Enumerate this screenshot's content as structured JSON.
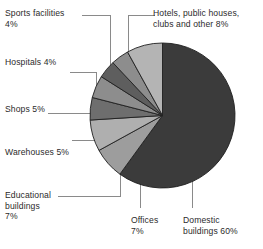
{
  "chart_data": {
    "type": "pie",
    "title": "",
    "subtitle": "",
    "xlabel": "",
    "ylabel": "",
    "legend_position": "none",
    "grid": false,
    "labels_with_leader_lines": true,
    "start_angle_deg": 0,
    "direction": "clockwise",
    "unit": "%",
    "categories": [
      "Domestic buildings",
      "Offices",
      "Educational buildings",
      "Warehouses",
      "Shops",
      "Hospitals",
      "Sports facilities",
      "Hotels, public houses, clubs and other"
    ],
    "values": [
      60,
      7,
      7,
      5,
      5,
      4,
      4,
      8
    ],
    "slices": [
      {
        "name": "Domestic buildings",
        "value": 60,
        "label": "Domestic buildings 60%",
        "color": "#3b3b3b"
      },
      {
        "name": "Offices",
        "value": 7,
        "label": "Offices 7%",
        "color": "#9d9d9d"
      },
      {
        "name": "Educational buildings",
        "value": 7,
        "label": "Educational buildings 7%",
        "color": "#afafaf"
      },
      {
        "name": "Warehouses",
        "value": 5,
        "label": "Warehouses 5%",
        "color": "#6e6e6e"
      },
      {
        "name": "Shops",
        "value": 5,
        "label": "Shops 5%",
        "color": "#8d8d8d"
      },
      {
        "name": "Hospitals",
        "value": 4,
        "label": "Hospitals 4%",
        "color": "#5e5e5e"
      },
      {
        "name": "Sports facilities",
        "value": 4,
        "label": "Sports facilities 4%",
        "color": "#8d8d8d"
      },
      {
        "name": "Hotels, public houses, clubs and other",
        "value": 8,
        "label": "Hotels, public houses, clubs and other 8%",
        "color": "#b4b4b4"
      }
    ]
  },
  "labels": {
    "sports": "Sports facilities\n4%",
    "hotels": "Hotels, public houses,\nclubs and other 8%",
    "hospitals": "Hospitals 4%",
    "shops": "Shops 5%",
    "warehouses": "Warehouses 5%",
    "educational": "Educational\nbuildings\n7%",
    "offices": "Offices\n7%",
    "domestic": "Domestic\nbuildings 60%"
  },
  "colors": {
    "background": "#ffffff",
    "text": "#2b2b2b",
    "leader_line": "#8a8a8a",
    "slice_edge": "#1f1f1f"
  }
}
